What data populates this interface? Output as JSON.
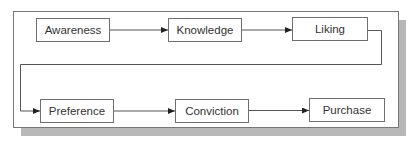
{
  "diagram": {
    "type": "flowchart",
    "nodes": [
      {
        "id": "awareness",
        "label": "Awareness"
      },
      {
        "id": "knowledge",
        "label": "Knowledge"
      },
      {
        "id": "liking",
        "label": "Liking"
      },
      {
        "id": "preference",
        "label": "Preference"
      },
      {
        "id": "conviction",
        "label": "Conviction"
      },
      {
        "id": "purchase",
        "label": "Purchase"
      }
    ],
    "edges": [
      {
        "from": "awareness",
        "to": "knowledge"
      },
      {
        "from": "knowledge",
        "to": "liking"
      },
      {
        "from": "liking",
        "to": "preference"
      },
      {
        "from": "preference",
        "to": "conviction"
      },
      {
        "from": "conviction",
        "to": "purchase"
      }
    ]
  }
}
